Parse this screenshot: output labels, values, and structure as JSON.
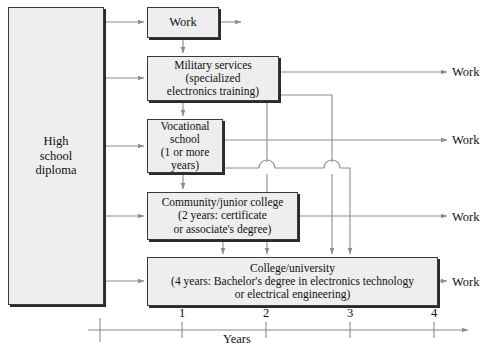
{
  "diagram": {
    "nodes": {
      "high_school": "High\nschool\ndiploma",
      "work_top": "Work",
      "military": "Military services\n(specialized\nelectronics training)",
      "vocational": "Vocational\nschool\n(1 or more\nyears)",
      "community": "Community/junior college\n(2 years: certificate\nor associate's degree)",
      "college": "College/university\n(4 years: Bachelor's degree in electronics technology\nor electrical engineering)"
    },
    "work_outputs": [
      {
        "label": "Work"
      },
      {
        "label": "Work"
      },
      {
        "label": "Work"
      },
      {
        "label": "Work"
      }
    ],
    "axis": {
      "title": "Years",
      "ticks": [
        "1",
        "2",
        "3",
        "4"
      ],
      "tick_positions_px": [
        182,
        266,
        350,
        434
      ],
      "origin_px": 100
    },
    "colors": {
      "node_fill": "#eeeeee",
      "node_border": "#3a3a3a",
      "node_shadow": "#2b2b2b",
      "wire": "#8c8c8c",
      "axis": "#8c8c8c",
      "text": "#101010",
      "page_background": "#ffffff"
    }
  }
}
